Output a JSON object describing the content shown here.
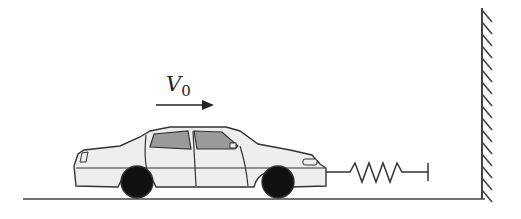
{
  "diagram": {
    "type": "physics-diagram",
    "velocity": {
      "symbol": "V",
      "subscript": "0",
      "direction": "right"
    },
    "objects": [
      {
        "name": "car",
        "kind": "sedan",
        "facing": "right"
      },
      {
        "name": "spring",
        "attached_to": "car front bumper",
        "coils": 4
      },
      {
        "name": "wall",
        "kind": "fixed wall with hatching",
        "side": "right"
      },
      {
        "name": "ground",
        "kind": "horizontal line"
      }
    ],
    "colors": {
      "outline": "#333333",
      "car_body": "#eeeeee",
      "window": "#9a9a9a",
      "tire": "#111111",
      "background": "#ffffff"
    }
  }
}
